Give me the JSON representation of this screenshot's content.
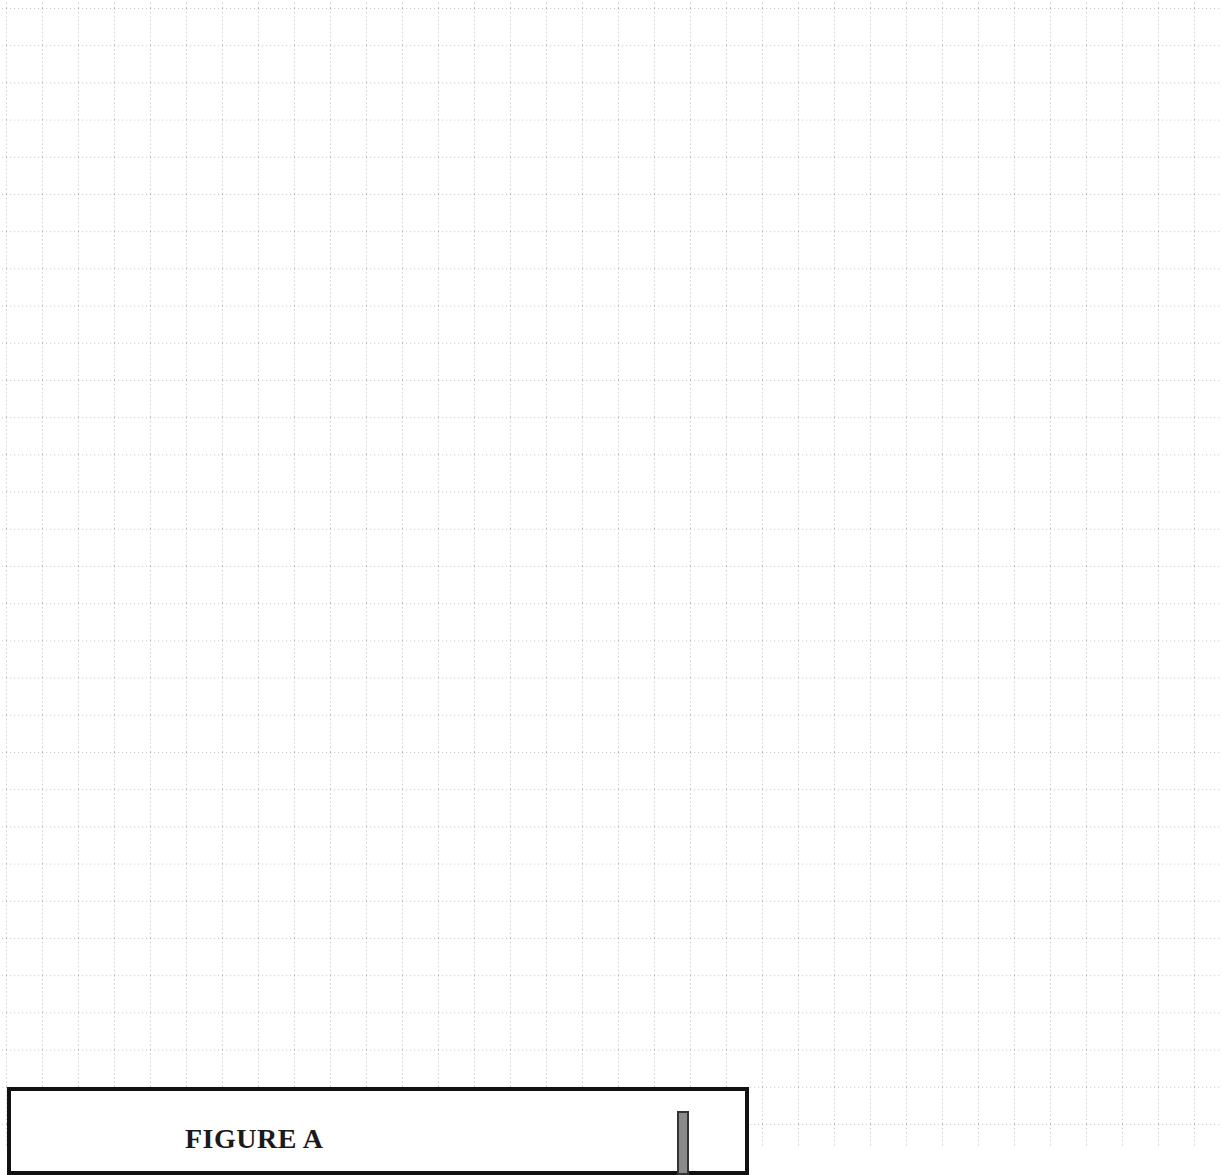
{
  "page": {
    "background": "#ffffff",
    "grid": {
      "style": "dotted",
      "line_color": "#9a9a9a",
      "cell_width_px": 36,
      "cell_height_px": 37.2,
      "offset_x_px": 6,
      "offset_y_px": 8
    }
  },
  "figure": {
    "title": "FIGURE A",
    "border_color": "#111111",
    "bar_color": "#8a8a8a"
  }
}
